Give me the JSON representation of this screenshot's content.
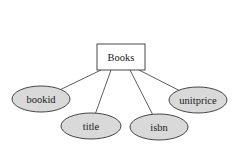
{
  "diagram": {
    "type": "er-diagram",
    "entity": {
      "label": "Books",
      "x": 97,
      "y": 44,
      "width": 48,
      "height": 26
    },
    "attributes": [
      {
        "label": "bookid",
        "cx": 41,
        "cy": 99,
        "rx": 29,
        "ry": 13,
        "anchor_x": 101
      },
      {
        "label": "title",
        "cx": 91,
        "cy": 126,
        "rx": 30,
        "ry": 13,
        "anchor_x": 111
      },
      {
        "label": "isbn",
        "cx": 159,
        "cy": 127,
        "rx": 29,
        "ry": 13,
        "anchor_x": 130
      },
      {
        "label": "unitprice",
        "cx": 198,
        "cy": 100,
        "rx": 29,
        "ry": 13,
        "anchor_x": 139
      }
    ],
    "colors": {
      "attribute_fill": "#d9d9d9",
      "stroke": "#333333",
      "entity_fill": "#ffffff"
    }
  }
}
